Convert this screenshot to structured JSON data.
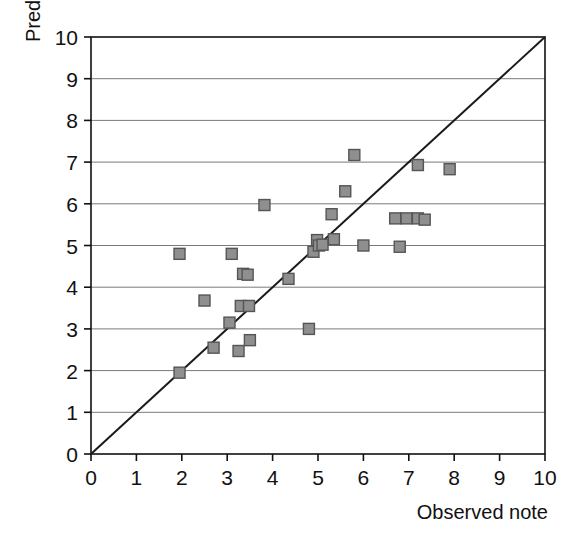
{
  "chart_data": {
    "type": "scatter",
    "title": "",
    "xlabel": "Observed note",
    "ylabel": "Predictive note",
    "xlim": [
      0,
      10
    ],
    "ylim": [
      0,
      10
    ],
    "xticks": [
      0,
      1,
      2,
      3,
      4,
      5,
      6,
      7,
      8,
      9,
      10
    ],
    "yticks": [
      0,
      1,
      2,
      3,
      4,
      5,
      6,
      7,
      8,
      9,
      10
    ],
    "xtick_labels": [
      "0",
      "1",
      "2",
      "3",
      "4",
      "5",
      "6",
      "7",
      "8",
      "9",
      "10"
    ],
    "ytick_labels": [
      "0",
      "1",
      "2",
      "3",
      "4",
      "5",
      "6",
      "7",
      "8",
      "9",
      "10"
    ],
    "grid": "horizontal",
    "legend": "none",
    "marker": {
      "shape": "square",
      "fill": "#8f8f8f",
      "edge": "#555555",
      "size_px": 11
    },
    "reference_line": {
      "name": "identity-line",
      "from": [
        0,
        0
      ],
      "to": [
        10,
        10
      ],
      "color": "#1a1a1a",
      "width_px": 2
    },
    "points": [
      {
        "x": 1.95,
        "y": 1.95
      },
      {
        "x": 1.95,
        "y": 4.8
      },
      {
        "x": 2.5,
        "y": 3.68
      },
      {
        "x": 2.7,
        "y": 2.55
      },
      {
        "x": 3.05,
        "y": 3.15
      },
      {
        "x": 3.1,
        "y": 4.8
      },
      {
        "x": 3.25,
        "y": 2.47
      },
      {
        "x": 3.3,
        "y": 3.55
      },
      {
        "x": 3.35,
        "y": 4.32
      },
      {
        "x": 3.45,
        "y": 4.3
      },
      {
        "x": 3.48,
        "y": 3.55
      },
      {
        "x": 3.5,
        "y": 2.73
      },
      {
        "x": 3.82,
        "y": 5.97
      },
      {
        "x": 4.35,
        "y": 4.2
      },
      {
        "x": 4.8,
        "y": 3.0
      },
      {
        "x": 4.9,
        "y": 4.85
      },
      {
        "x": 4.98,
        "y": 5.13
      },
      {
        "x": 5.02,
        "y": 5.0
      },
      {
        "x": 5.1,
        "y": 5.02
      },
      {
        "x": 5.3,
        "y": 5.75
      },
      {
        "x": 5.35,
        "y": 5.15
      },
      {
        "x": 5.6,
        "y": 6.3
      },
      {
        "x": 5.8,
        "y": 7.17
      },
      {
        "x": 6.0,
        "y": 5.0
      },
      {
        "x": 6.7,
        "y": 5.65
      },
      {
        "x": 6.8,
        "y": 4.97
      },
      {
        "x": 6.95,
        "y": 5.65
      },
      {
        "x": 7.2,
        "y": 5.65
      },
      {
        "x": 7.2,
        "y": 6.93
      },
      {
        "x": 7.35,
        "y": 5.62
      },
      {
        "x": 7.9,
        "y": 6.83
      }
    ]
  },
  "colors": {
    "marker_fill": "#8f8f8f",
    "marker_edge": "#555555",
    "gridline": "#7a7a7a",
    "axis": "#111111",
    "reference_line": "#1a1a1a",
    "background": "#ffffff"
  }
}
